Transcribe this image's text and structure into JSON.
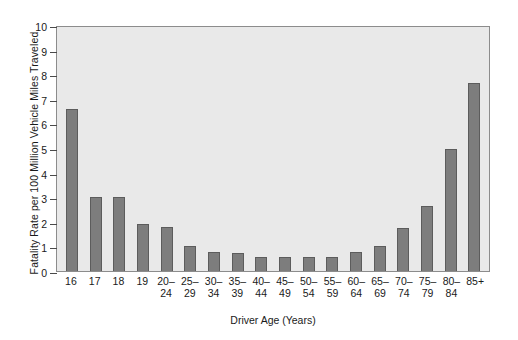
{
  "chart_data": {
    "type": "bar",
    "title": "",
    "xlabel": "Driver Age (Years)",
    "ylabel": "Fatality Rate per 100 Million Vehicle Miles Traveled",
    "ylim": [
      0,
      10
    ],
    "yticks": [
      0,
      1,
      2,
      3,
      4,
      5,
      6,
      7,
      8,
      9,
      10
    ],
    "ytick_labels": [
      "0",
      "1",
      "2",
      "3",
      "4",
      "5",
      "6",
      "7",
      "8",
      "9",
      "10"
    ],
    "grid": false,
    "legend": null,
    "bar_color": "#7d7d7d",
    "bar_edge_color": "#5c5c5c",
    "plot_background": "#e9e9e9",
    "figure_background": "#ffffff",
    "categories": [
      "16",
      "17",
      "18",
      "19",
      "20–24",
      "25–29",
      "30–34",
      "35–39",
      "40–44",
      "45–49",
      "50–54",
      "55–59",
      "60–64",
      "65–69",
      "70–74",
      "75–79",
      "80–84",
      "85+"
    ],
    "category_lines": [
      [
        "16",
        ""
      ],
      [
        "17",
        ""
      ],
      [
        "18",
        ""
      ],
      [
        "19",
        ""
      ],
      [
        "20–",
        "24"
      ],
      [
        "25–",
        "29"
      ],
      [
        "30–",
        "34"
      ],
      [
        "35–",
        "39"
      ],
      [
        "40–",
        "44"
      ],
      [
        "45–",
        "49"
      ],
      [
        "50–",
        "54"
      ],
      [
        "55–",
        "59"
      ],
      [
        "60–",
        "64"
      ],
      [
        "65–",
        "69"
      ],
      [
        "70–",
        "74"
      ],
      [
        "75–",
        "79"
      ],
      [
        "80–",
        "84"
      ],
      [
        "85+",
        ""
      ]
    ],
    "values": [
      6.6,
      3.0,
      3.0,
      1.9,
      1.77,
      1.0,
      0.78,
      0.72,
      0.55,
      0.55,
      0.55,
      0.57,
      0.78,
      1.0,
      1.73,
      2.65,
      4.95,
      7.65
    ]
  }
}
